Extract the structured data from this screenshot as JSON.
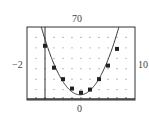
{
  "chart_data": {
    "type": "scatter",
    "title": "",
    "xlabel": "",
    "ylabel": "",
    "window": {
      "xmin": -2,
      "xmax": 10,
      "ymin": 0,
      "ymax": 70,
      "xscl": 1,
      "yscl": 10
    },
    "labels": {
      "ymax": "70",
      "xmin": "−2",
      "xmax": "10",
      "ymin": "0"
    },
    "grid": "dots",
    "series": [
      {
        "name": "data",
        "marker": "filled-square",
        "x": [
          0,
          1,
          2,
          3,
          4,
          5,
          6,
          7,
          8
        ],
        "y": [
          52,
          31,
          20,
          11,
          7,
          10,
          20,
          33,
          49
        ]
      },
      {
        "name": "model",
        "type": "line",
        "equation": "y = 3.5(x - 3.9)^2 + 5",
        "a": 3.5,
        "h": 3.9,
        "k": 5
      }
    ],
    "colors": {
      "frame": "#333333",
      "grid": "#888888",
      "curve": "#333333",
      "marker": "#222222"
    }
  }
}
